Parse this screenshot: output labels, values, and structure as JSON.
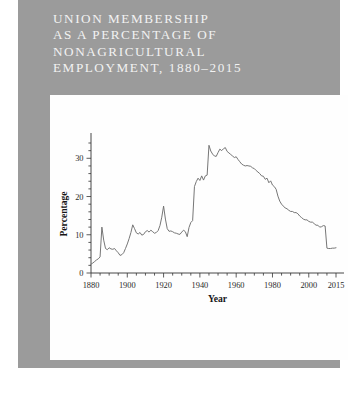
{
  "figure": {
    "title_lines": [
      "UNION MEMBERSHIP",
      "AS A PERCENTAGE OF",
      "NONAGRICULTURAL",
      "EMPLOYMENT, 1880–2015"
    ],
    "panel_color": "#9b9b9b",
    "title_color": "#f2f2f2",
    "chart_bg": "#fefefe"
  },
  "chart_data": {
    "type": "line",
    "xlabel": "Year",
    "ylabel": "Percentage",
    "xlim": [
      1880,
      2015
    ],
    "ylim": [
      0,
      34
    ],
    "grid": false,
    "legend": null,
    "line_color": "#6f6f6f",
    "xticks": [
      1880,
      1900,
      1920,
      1940,
      1960,
      1980,
      2000,
      2015
    ],
    "xtick_labels": [
      "1880",
      "1900",
      "1920",
      "1940",
      "1960",
      "1980",
      "2000",
      "2015"
    ],
    "xminor_step": 5,
    "yticks": [
      0,
      10,
      20,
      30
    ],
    "ytick_labels": [
      "0",
      "10",
      "20",
      "30"
    ],
    "yminor_step": 2,
    "series": [
      {
        "name": "Union membership (% of nonagricultural employment)",
        "x": [
          1880,
          1881,
          1882,
          1883,
          1884,
          1885,
          1886,
          1887,
          1888,
          1889,
          1890,
          1891,
          1892,
          1893,
          1894,
          1895,
          1896,
          1897,
          1898,
          1899,
          1900,
          1901,
          1902,
          1903,
          1904,
          1905,
          1906,
          1907,
          1908,
          1909,
          1910,
          1911,
          1912,
          1913,
          1914,
          1915,
          1916,
          1917,
          1918,
          1919,
          1920,
          1921,
          1922,
          1923,
          1924,
          1925,
          1926,
          1927,
          1928,
          1929,
          1930,
          1931,
          1932,
          1933,
          1934,
          1935,
          1936,
          1937,
          1938,
          1939,
          1940,
          1941,
          1942,
          1943,
          1944,
          1945,
          1946,
          1947,
          1948,
          1949,
          1950,
          1951,
          1952,
          1953,
          1954,
          1955,
          1956,
          1957,
          1958,
          1959,
          1960,
          1961,
          1962,
          1963,
          1964,
          1965,
          1966,
          1967,
          1968,
          1969,
          1970,
          1971,
          1972,
          1973,
          1974,
          1975,
          1976,
          1977,
          1978,
          1979,
          1980,
          1981,
          1982,
          1983,
          1984,
          1985,
          1986,
          1987,
          1988,
          1989,
          1990,
          1991,
          1992,
          1993,
          1994,
          1995,
          1996,
          1997,
          1998,
          1999,
          2000,
          2001,
          2002,
          2003,
          2004,
          2005,
          2006,
          2007,
          2008,
          2009,
          2010,
          2011,
          2012,
          2013,
          2014,
          2015
        ],
        "values": [
          2.3,
          2.6,
          3.0,
          3.4,
          3.7,
          4.2,
          12.0,
          8.6,
          6.4,
          6.1,
          6.6,
          6.3,
          6.2,
          6.4,
          5.8,
          5.3,
          4.6,
          4.8,
          5.3,
          6.4,
          7.6,
          9.0,
          10.6,
          12.6,
          11.6,
          10.5,
          10.2,
          10.6,
          9.9,
          10.1,
          10.8,
          11.1,
          10.7,
          11.2,
          10.8,
          10.4,
          10.6,
          11.1,
          12.4,
          14.6,
          17.5,
          14.1,
          11.6,
          10.9,
          11.0,
          10.8,
          10.5,
          10.4,
          10.2,
          10.1,
          10.7,
          11.2,
          10.8,
          9.5,
          11.9,
          13.2,
          13.7,
          22.6,
          23.9,
          24.8,
          24.2,
          25.4,
          24.3,
          25.4,
          25.6,
          33.4,
          31.9,
          31.1,
          30.6,
          30.5,
          31.5,
          32.4,
          32.0,
          32.5,
          32.8,
          31.8,
          31.4,
          31.0,
          30.6,
          30.2,
          30.4,
          29.7,
          29.1,
          28.5,
          28.2,
          28.0,
          28.1,
          28.0,
          27.9,
          27.5,
          27.3,
          26.8,
          26.4,
          26.0,
          25.4,
          25.3,
          24.5,
          24.8,
          23.6,
          24.1,
          23.0,
          22.6,
          21.9,
          20.1,
          18.8,
          18.0,
          17.5,
          17.0,
          16.8,
          16.4,
          16.1,
          16.1,
          15.8,
          15.8,
          15.5,
          14.9,
          14.5,
          14.1,
          13.9,
          13.9,
          13.5,
          13.3,
          13.3,
          12.9,
          12.5,
          12.5,
          12.0,
          12.1,
          12.4,
          12.3,
          6.5,
          6.4,
          6.4,
          6.5,
          6.5,
          6.6
        ]
      }
    ]
  }
}
